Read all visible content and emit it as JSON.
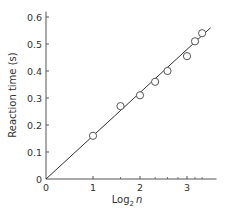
{
  "chart_data": {
    "type": "scatter",
    "title": "",
    "xlabel": "Log2 n",
    "xlabel_parts": {
      "base": "Log",
      "sub": "2",
      "var": "n"
    },
    "ylabel": "Reaction time (s)",
    "xlim": [
      0,
      3.5
    ],
    "ylim": [
      0,
      0.62
    ],
    "grid": false,
    "legend": null,
    "x_ticks": [
      0,
      1,
      2,
      3
    ],
    "x_tick_labels": [
      "0",
      "1",
      "2",
      "3"
    ],
    "x_minor_ticks": [
      1.585,
      2.322,
      2.585,
      2.807,
      3.17,
      3.322
    ],
    "y_ticks": [
      0,
      0.1,
      0.2,
      0.3,
      0.4,
      0.5,
      0.6
    ],
    "y_tick_labels": [
      "0",
      "0.1",
      "0.2",
      "0.3",
      "0.4",
      "0.5",
      "0.6"
    ],
    "series": [
      {
        "name": "Observed",
        "marker": "open-circle",
        "x": [
          1.0,
          1.585,
          2.0,
          2.322,
          2.585,
          3.0,
          3.17,
          3.322
        ],
        "y": [
          0.16,
          0.27,
          0.31,
          0.36,
          0.4,
          0.455,
          0.51,
          0.54
        ]
      },
      {
        "name": "Linear fit",
        "style": "line",
        "x": [
          0,
          3.5
        ],
        "y": [
          0,
          0.56
        ]
      }
    ],
    "colors": {
      "axis": "#555555",
      "line": "#333333",
      "marker_edge": "#444444",
      "marker_fill": "#ffffff",
      "text": "#333333"
    }
  }
}
